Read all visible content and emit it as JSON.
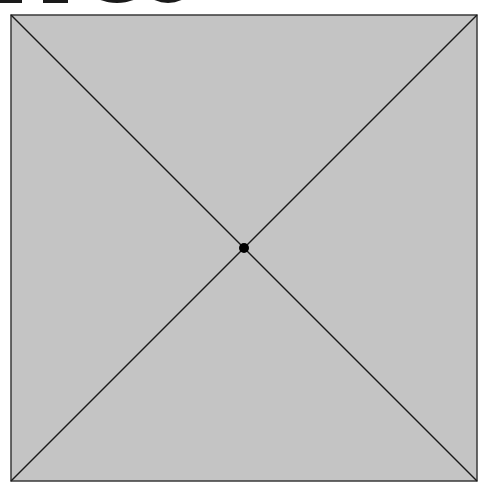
{
  "header": {
    "cropped_text_visible": "",
    "note": "Bottom edges of large black heading glyphs, cropped at top"
  },
  "diagram": {
    "shape": "square-with-diagonals",
    "square": {
      "x": 11,
      "y": 15,
      "width": 466,
      "height": 466
    },
    "fill_color": "#c4c4c4",
    "stroke_color": "#1a1a1a",
    "center_point": {
      "x": 244,
      "y": 248,
      "radius": 5
    },
    "center_label": ""
  }
}
